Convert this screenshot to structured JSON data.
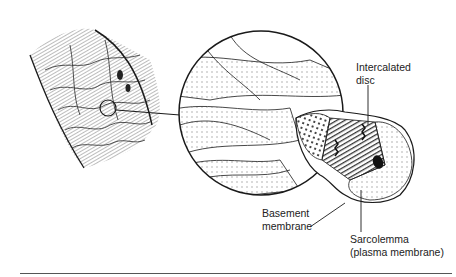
{
  "figure": {
    "labels": {
      "intercalated_disc": [
        "Intercalated",
        "disc"
      ],
      "basement_membrane": [
        "Basement",
        "membrane"
      ],
      "sarcolemma": [
        "Sarcolemma",
        "(plasma membrane)"
      ]
    },
    "colors": {
      "ink": "#1a1a1a",
      "hatch": "#6a6a6a",
      "rule": "#555555",
      "background": "#ffffff"
    }
  }
}
